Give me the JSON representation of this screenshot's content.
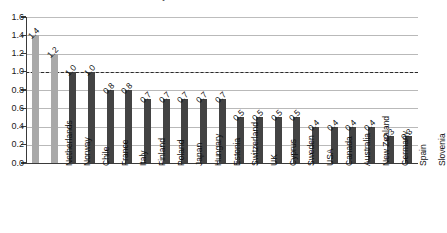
{
  "chart_data": {
    "type": "bar",
    "title": "the country as someone born in the 1980s.",
    "xlabel": "",
    "ylabel": "",
    "ylim": [
      0.0,
      1.6
    ],
    "yticks": [
      "0.0",
      "0.2",
      "0.4",
      "0.6",
      "0.8",
      "1.0",
      "1.2",
      "1.4",
      "1.6"
    ],
    "grid": true,
    "legend": "none",
    "reference_line": 1.0,
    "categories": [
      "Netherlands",
      "Norway",
      "Chile",
      "France",
      "Italy",
      "Finland",
      "Poland",
      "Japan",
      "Hungary",
      "Estonia",
      "Switzerland",
      "UK",
      "Cyprus",
      "Sweden",
      "USA",
      "Canada",
      "Australia",
      "New Zealand",
      "Germany",
      "Spain",
      "Slovenia"
    ],
    "values": [
      1.4,
      1.2,
      1.0,
      1.0,
      0.8,
      0.8,
      0.7,
      0.7,
      0.7,
      0.7,
      0.7,
      0.5,
      0.5,
      0.5,
      0.5,
      0.4,
      0.4,
      0.4,
      0.4,
      0.3,
      0.3
    ],
    "value_labels": [
      "1.4",
      "1.2",
      "1.0",
      "1.0",
      "0.8",
      "0.8",
      "0.7",
      "0.7",
      "0.7",
      "0.7",
      "0.7",
      "0.5",
      "0.5",
      "0.5",
      "0.5",
      "0.4",
      "0.4",
      "0.4",
      "0.4",
      "0.3",
      "0.3"
    ],
    "bar_colors": [
      "#a9a9a9",
      "#a9a9a9",
      "#434343",
      "#434343",
      "#434343",
      "#434343",
      "#434343",
      "#434343",
      "#434343",
      "#434343",
      "#434343",
      "#434343",
      "#434343",
      "#434343",
      "#434343",
      "#434343",
      "#434343",
      "#434343",
      "#434343",
      "#434343",
      "#434343"
    ],
    "colors": {
      "highlight_bar": "#a9a9a9",
      "standard_bar": "#434343",
      "gridline": "#b9b9b9",
      "axis": "#3a3a3a",
      "reference_line": "#2a2a2a",
      "background": "#ffffff",
      "text": "#111111"
    }
  }
}
